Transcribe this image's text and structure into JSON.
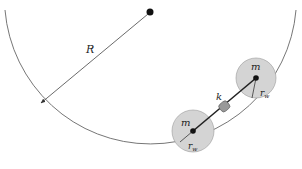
{
  "diagram": {
    "labels": {
      "radius": "R",
      "mass_upper": "m",
      "mass_lower": "m",
      "spring": "k",
      "wheel_radius_upper": "r",
      "wheel_radius_lower": "r",
      "subscript": "w"
    },
    "colors": {
      "line": "#555555",
      "wheel_fill": "#d4d4d4",
      "wheel_stroke": "#8a8a8a",
      "axle": "#111111"
    }
  }
}
